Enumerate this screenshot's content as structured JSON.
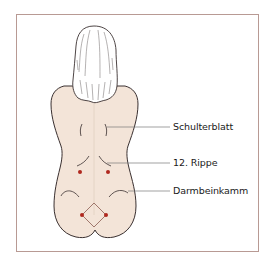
{
  "figure": {
    "colors": {
      "frame_border": "#b89a94",
      "skin": "#f3e4d8",
      "outline": "#3a3030",
      "hair_fill": "#ffffff",
      "leader_line": "#7a7a7a",
      "point": "#b0281e"
    },
    "labels": [
      {
        "id": "schulterblatt",
        "text": "Schulterblatt",
        "y": 127
      },
      {
        "id": "rippe12",
        "text": "12. Rippe",
        "y": 163
      },
      {
        "id": "darmbeinkamm",
        "text": "Darmbeinkamm",
        "y": 191
      }
    ],
    "points": [
      {
        "name": "upper-left-point",
        "x": 80,
        "y": 172
      },
      {
        "name": "upper-right-point",
        "x": 108,
        "y": 172
      },
      {
        "name": "lower-left-point",
        "x": 82,
        "y": 215
      },
      {
        "name": "lower-right-point",
        "x": 106,
        "y": 215
      }
    ]
  }
}
